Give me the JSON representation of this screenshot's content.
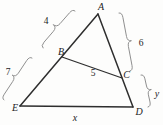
{
  "figure": {
    "vertex_labels": {
      "A": "A",
      "B": "B",
      "C": "C",
      "D": "D",
      "E": "E"
    },
    "segment_labels": {
      "AB": "4",
      "BE": "7",
      "AC": "6",
      "CD": "y",
      "BC": "5",
      "ED": "x"
    },
    "colors": {
      "ink": "#2e2e2e",
      "brace": "#8f8f8f",
      "text": "#1c1c1c"
    }
  }
}
